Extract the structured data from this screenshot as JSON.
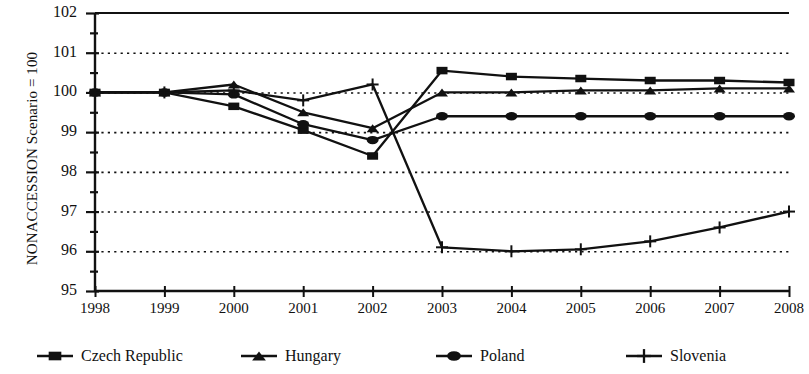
{
  "chart_data": {
    "type": "line",
    "title": "",
    "xlabel": "",
    "ylabel": "NONACCESSION Scenario = 100",
    "x": [
      1998,
      1999,
      2000,
      2001,
      2002,
      2003,
      2004,
      2005,
      2006,
      2007,
      2008
    ],
    "xtick_labels": [
      "1998",
      "1999",
      "2000",
      "2001",
      "2002",
      "2003",
      "2004",
      "2005",
      "2006",
      "2007",
      "2008"
    ],
    "ytick_labels": [
      "95",
      "96",
      "97",
      "98",
      "99",
      "100",
      "101",
      "102"
    ],
    "yticks": [
      95,
      96,
      97,
      98,
      99,
      100,
      101,
      102
    ],
    "ylim": [
      95,
      102
    ],
    "xlim": [
      1998,
      2008
    ],
    "minor_ytick_step": 0.5,
    "grid": "horizontal-dotted",
    "legend_position": "bottom",
    "series": [
      {
        "name": "Czech Republic",
        "marker": "square",
        "values": [
          100.0,
          100.0,
          99.65,
          99.05,
          98.4,
          100.55,
          100.4,
          100.35,
          100.3,
          100.3,
          100.25
        ]
      },
      {
        "name": "Hungary",
        "marker": "triangle",
        "values": [
          100.0,
          100.0,
          100.2,
          99.5,
          99.1,
          100.0,
          100.0,
          100.05,
          100.05,
          100.1,
          100.1
        ]
      },
      {
        "name": "Poland",
        "marker": "circle",
        "values": [
          100.0,
          100.0,
          99.95,
          99.2,
          98.8,
          99.4,
          99.4,
          99.4,
          99.4,
          99.4,
          99.4
        ]
      },
      {
        "name": "Slovenia",
        "marker": "plus",
        "values": [
          100.0,
          100.0,
          100.05,
          99.8,
          100.2,
          96.1,
          96.0,
          96.05,
          96.25,
          96.6,
          97.0
        ]
      }
    ]
  },
  "axis": {
    "ylabel": "NONACCESSION Scenario = 100"
  },
  "legend": {
    "items": [
      {
        "label": "Czech Republic",
        "marker": "square"
      },
      {
        "label": "Hungary",
        "marker": "triangle"
      },
      {
        "label": "Poland",
        "marker": "circle"
      },
      {
        "label": "Slovenia",
        "marker": "plus"
      }
    ]
  }
}
